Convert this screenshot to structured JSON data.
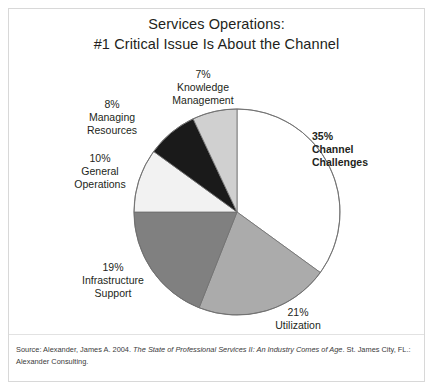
{
  "slide": {
    "title_line_1": "Services Operations:",
    "title_line_2": "#1 Critical Issue Is About the Channel",
    "background_color": "#ffffff",
    "border_color": "#d8d8d8",
    "text_color": "#231f20"
  },
  "source": {
    "prefix": "Source: Alexander, James A. 2004. ",
    "italic_title": "The State of Professional Services II: An Industry Comes of Age",
    "suffix": ". St. James City, FL.: Alexander Consulting."
  },
  "labels": {
    "channel_challenges": {
      "percent": "35%",
      "name_line_1": "Channel",
      "name_line_2": "Challenges"
    },
    "utilization": {
      "percent": "21%",
      "name_line_1": "Utilization",
      "name_line_2": ""
    },
    "infrastructure_support": {
      "percent": "19%",
      "name_line_1": "Infrastructure",
      "name_line_2": "Support"
    },
    "general_operations": {
      "percent": "10%",
      "name_line_1": "General",
      "name_line_2": "Operations"
    },
    "managing_resources": {
      "percent": "8%",
      "name_line_1": "Managing",
      "name_line_2": "Resources"
    },
    "knowledge_management": {
      "percent": "7%",
      "name_line_1": "Knowledge",
      "name_line_2": "Management"
    }
  },
  "chart_data": {
    "type": "pie",
    "title": "Services Operations: #1 Critical Issue Is About the Channel",
    "xlabel": "",
    "ylabel": "",
    "legend": "none",
    "grid": false,
    "units": "percent",
    "start_angle_deg": 0,
    "direction": "clockwise",
    "categories": [
      "Channel Challenges",
      "Utilization",
      "Infrastructure Support",
      "General Operations",
      "Managing Resources",
      "Knowledge Management"
    ],
    "values": [
      35,
      21,
      19,
      10,
      8,
      7
    ],
    "colors": [
      "#ffffff",
      "#ababab",
      "#808080",
      "#f2f2f2",
      "#1a1a1a",
      "#d0d0d0"
    ],
    "slice_border_color": "#6e6e6e",
    "geometry": {
      "cx": 104,
      "cy": 104,
      "r": 103
    }
  }
}
